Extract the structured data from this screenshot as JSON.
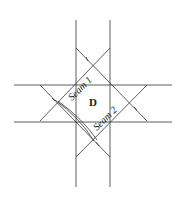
{
  "diagram": {
    "type": "geometric-seam-diagram",
    "line_color": "#333333",
    "background": "#ffffff",
    "labels": {
      "region": "D",
      "seam1": "Seam 1",
      "seam2": "Seam 2"
    },
    "elements": {
      "vertical_lines_x": [
        76,
        110
      ],
      "horizontal_lines_y": [
        85,
        122
      ],
      "diagonals": [
        {
          "from": [
            76,
            48
          ],
          "to": [
            147,
            121
          ]
        },
        {
          "from": [
            110,
            48
          ],
          "to": [
            40,
            121
          ]
        },
        {
          "from": [
            40,
            85
          ],
          "to": [
            110,
            157
          ]
        },
        {
          "from": [
            147,
            85
          ],
          "to": [
            76,
            157
          ]
        }
      ]
    }
  }
}
